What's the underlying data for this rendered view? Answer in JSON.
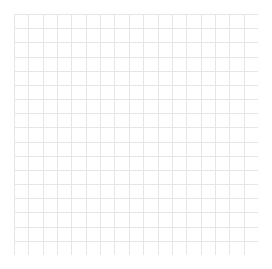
{
  "document": {
    "title": "Blank Grid Canvas",
    "type": "grid-paper"
  },
  "canvas": {
    "width": 272,
    "height": 269,
    "background_color": "#ffffff"
  },
  "grid": {
    "name": "graph-paper-grid",
    "origin_x": 14,
    "origin_y": 14,
    "width": 244,
    "height": 241,
    "columns": 17,
    "rows": 17,
    "cell_width": 14.35,
    "cell_height": 14.18,
    "line_color": "#e6e6e6",
    "line_width": 1,
    "border_color": "#e6e6e6",
    "fill_color": "#ffffff",
    "has_labels": false,
    "has_axes": false,
    "content": ""
  },
  "chart_data": {
    "type": "table",
    "title": "",
    "xlabel": "",
    "ylabel": "",
    "categories": [],
    "values": [],
    "grid": true,
    "legend": false,
    "note": "Empty grid: no plotted data points, no tick labels, no legend."
  }
}
